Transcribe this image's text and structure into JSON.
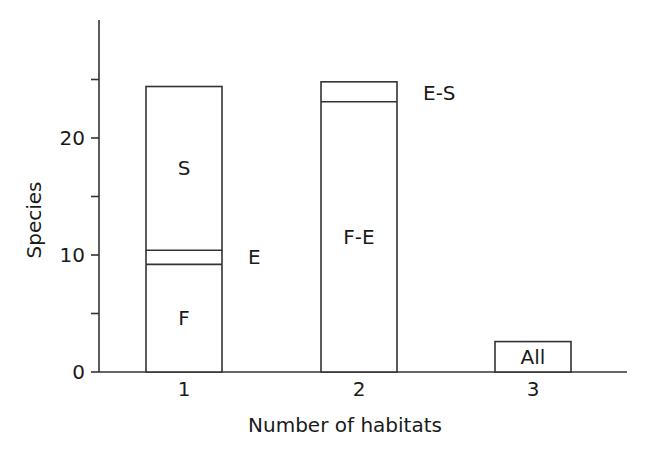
{
  "chart_data": {
    "type": "bar",
    "stacked": true,
    "title": "",
    "xlabel": "Number of habitats",
    "ylabel": "Species",
    "categories": [
      "1",
      "2",
      "3"
    ],
    "ylim": [
      0,
      29
    ],
    "yticks_major": [
      0,
      10,
      20
    ],
    "yticks_minor": [
      5,
      15,
      25
    ],
    "grid": false,
    "legend": null,
    "bars": [
      {
        "category": "1",
        "segments": [
          {
            "label": "F",
            "value": 9.2,
            "label_position": "inside"
          },
          {
            "label": "E",
            "value": 1.2,
            "label_position": "right"
          },
          {
            "label": "S",
            "value": 14.0,
            "label_position": "inside"
          }
        ],
        "total": 24.4
      },
      {
        "category": "2",
        "segments": [
          {
            "label": "F-E",
            "value": 23.1,
            "label_position": "inside"
          },
          {
            "label": "E-S",
            "value": 1.7,
            "label_position": "right"
          }
        ],
        "total": 24.8
      },
      {
        "category": "3",
        "segments": [
          {
            "label": "All",
            "value": 2.6,
            "label_position": "inside"
          }
        ],
        "total": 2.6
      }
    ],
    "colors": {
      "bar_fill": "#ffffff",
      "stroke": "#333333",
      "text": "#1a1a1a"
    }
  }
}
